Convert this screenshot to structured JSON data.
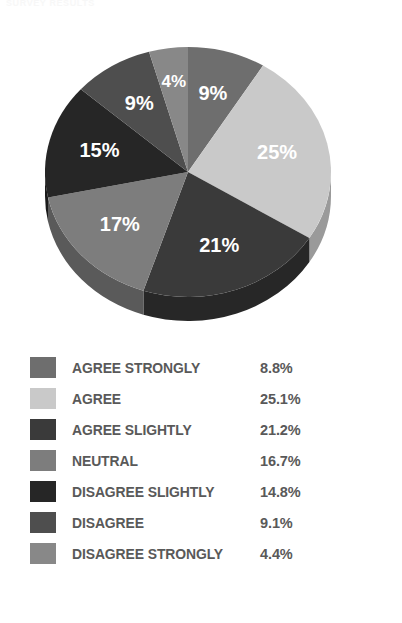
{
  "title_fragment": "SURVEY RESULTS",
  "chart_data": {
    "type": "pie",
    "title": "",
    "subtitle": "",
    "xlabel": "",
    "ylabel": "",
    "legend_position": "bottom",
    "grid": false,
    "start_angle_deg": 0,
    "direction": "clockwise",
    "three_d": true,
    "categories": [
      "AGREE STRONGLY",
      "AGREE",
      "AGREE SLIGHTLY",
      "NEUTRAL",
      "DISAGREE SLIGHTLY",
      "DISAGREE",
      "DISAGREE STRONGLY"
    ],
    "values": [
      8.8,
      25.1,
      21.2,
      16.7,
      14.8,
      9.1,
      4.4
    ],
    "value_labels": [
      "8.8%",
      "25.1%",
      "21.2%",
      "16.7%",
      "14.8%",
      "9.1%",
      "4.4%"
    ],
    "slice_annotations": [
      "9%",
      "25%",
      "21%",
      "17%",
      "15%",
      "9%",
      "4%"
    ],
    "colors": [
      "#6e6e6e",
      "#c9c9c9",
      "#3a3a3a",
      "#7d7d7d",
      "#262626",
      "#4e4e4e",
      "#888888"
    ],
    "units": "percent"
  },
  "pie": {
    "slices": [
      {
        "name": "AGREE STRONGLY",
        "annotation": "9%",
        "color": "#6e6e6e",
        "side_color": "#4f4f4f"
      },
      {
        "name": "AGREE",
        "annotation": "25%",
        "color": "#c9c9c9",
        "side_color": "#9a9a9a"
      },
      {
        "name": "AGREE SLIGHTLY",
        "annotation": "21%",
        "color": "#3a3a3a",
        "side_color": "#272727"
      },
      {
        "name": "NEUTRAL",
        "annotation": "17%",
        "color": "#7d7d7d",
        "side_color": "#5a5a5a"
      },
      {
        "name": "DISAGREE SLIGHTLY",
        "annotation": "15%",
        "color": "#262626",
        "side_color": "#1a1a1a"
      },
      {
        "name": "DISAGREE",
        "annotation": "9%",
        "color": "#4e4e4e",
        "side_color": "#383838"
      },
      {
        "name": "DISAGREE STRONGLY",
        "annotation": "4%",
        "color": "#888888",
        "side_color": "#636363"
      }
    ]
  },
  "legend": {
    "rows": [
      {
        "label": "AGREE STRONGLY",
        "value": "8.8%",
        "color": "#6e6e6e"
      },
      {
        "label": "AGREE",
        "value": "25.1%",
        "color": "#c9c9c9"
      },
      {
        "label": "AGREE SLIGHTLY",
        "value": "21.2%",
        "color": "#3a3a3a"
      },
      {
        "label": "NEUTRAL",
        "value": "16.7%",
        "color": "#7d7d7d"
      },
      {
        "label": "DISAGREE SLIGHTLY",
        "value": "14.8%",
        "color": "#262626"
      },
      {
        "label": "DISAGREE",
        "value": "9.1%",
        "color": "#4e4e4e"
      },
      {
        "label": "DISAGREE STRONGLY",
        "value": "4.4%",
        "color": "#888888"
      }
    ]
  },
  "style": {
    "background": "#ffffff",
    "label_text_color": "#595959",
    "pie_label_color": "#ffffff"
  }
}
